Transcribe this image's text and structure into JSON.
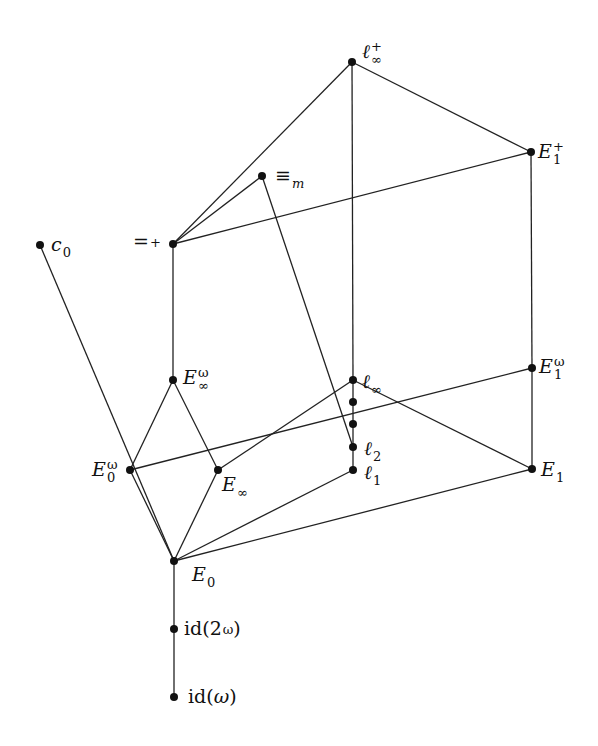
{
  "diagram": {
    "type": "hasse-diagram",
    "nodes": [
      {
        "id": "linf_plus",
        "base": "ℓ",
        "sub": "∞",
        "sup": "+",
        "x": 352,
        "y": 62,
        "lx": 362,
        "ly": 40
      },
      {
        "id": "E1_plus",
        "base": "E",
        "sub": "1",
        "sup": "+",
        "x": 531,
        "y": 152,
        "lx": 538,
        "ly": 140
      },
      {
        "id": "equiv_m",
        "base": "≡",
        "sub": "m",
        "sup": "",
        "x": 262,
        "y": 176,
        "lx": 275,
        "ly": 164
      },
      {
        "id": "eq_plus",
        "base": "=",
        "sub": "",
        "sup": "+",
        "x": 173,
        "y": 244,
        "lx": 133,
        "ly": 232
      },
      {
        "id": "c0",
        "base": "c",
        "sub": "0",
        "sup": "",
        "x": 40,
        "y": 245,
        "lx": 51,
        "ly": 233
      },
      {
        "id": "Einf_omega",
        "base": "E",
        "sub": "∞",
        "sup": "ω",
        "x": 173,
        "y": 380,
        "lx": 183,
        "ly": 366
      },
      {
        "id": "linf",
        "base": "ℓ",
        "sub": "∞",
        "sup": "",
        "x": 353,
        "y": 380,
        "lx": 362,
        "ly": 370
      },
      {
        "id": "dot1",
        "base": "",
        "sub": "",
        "sup": "",
        "x": 353,
        "y": 402
      },
      {
        "id": "dot2",
        "base": "",
        "sub": "",
        "sup": "",
        "x": 353,
        "y": 424
      },
      {
        "id": "l2",
        "base": "ℓ",
        "sub": "2",
        "sup": "",
        "x": 353,
        "y": 447,
        "lx": 364,
        "ly": 437
      },
      {
        "id": "l1",
        "base": "ℓ",
        "sub": "1",
        "sup": "",
        "x": 353,
        "y": 470,
        "lx": 364,
        "ly": 461
      },
      {
        "id": "E1_omega",
        "base": "E",
        "sub": "1",
        "sup": "ω",
        "x": 532,
        "y": 368,
        "lx": 539,
        "ly": 355
      },
      {
        "id": "E1",
        "base": "E",
        "sub": "1",
        "sup": "",
        "x": 532,
        "y": 469,
        "lx": 541,
        "ly": 458
      },
      {
        "id": "E0_omega",
        "base": "E",
        "sub": "0",
        "sup": "ω",
        "x": 130,
        "y": 470,
        "lx": 92,
        "ly": 458
      },
      {
        "id": "Einf",
        "base": "E",
        "sub": "∞",
        "sup": "",
        "x": 218,
        "y": 470,
        "lx": 222,
        "ly": 473
      },
      {
        "id": "E0",
        "base": "E",
        "sub": "0",
        "sup": "",
        "x": 174,
        "y": 561,
        "lx": 192,
        "ly": 563
      },
      {
        "id": "id_2omega",
        "base": "id(2",
        "sub": "",
        "sup": "ω",
        "tail": ")",
        "upright": true,
        "x": 174,
        "y": 629,
        "lx": 184,
        "ly": 619
      },
      {
        "id": "id_omega",
        "base": "id(",
        "sub": "",
        "sup": "",
        "mid": "ω",
        "tail": ")",
        "upright": true,
        "x": 174,
        "y": 697,
        "lx": 188,
        "ly": 687
      }
    ],
    "edges": [
      [
        "linf_plus",
        "eq_plus"
      ],
      [
        "linf_plus",
        "linf"
      ],
      [
        "linf_plus",
        "E1_plus"
      ],
      [
        "E1_plus",
        "eq_plus"
      ],
      [
        "E1_plus",
        "E1_omega"
      ],
      [
        "equiv_m",
        "eq_plus"
      ],
      [
        "equiv_m",
        "l2"
      ],
      [
        "eq_plus",
        "Einf_omega"
      ],
      [
        "Einf_omega",
        "E0_omega"
      ],
      [
        "Einf_omega",
        "Einf"
      ],
      [
        "linf",
        "Einf"
      ],
      [
        "linf",
        "E1"
      ],
      [
        "linf",
        "l1"
      ],
      [
        "E1_omega",
        "E0_omega"
      ],
      [
        "E1_omega",
        "E1"
      ],
      [
        "E0",
        "E0_omega"
      ],
      [
        "E0",
        "Einf"
      ],
      [
        "E0",
        "l1"
      ],
      [
        "E0",
        "E1"
      ],
      [
        "E0",
        "c0"
      ],
      [
        "E0",
        "id_2omega"
      ],
      [
        "id_2omega",
        "id_omega"
      ]
    ],
    "labels": {
      "linf_plus": "ℓ∞⁺",
      "E1_plus": "E₁⁺",
      "equiv_m": "≡ₘ",
      "eq_plus": "=⁺",
      "c0": "c₀",
      "Einf_omega": "E∞^ω",
      "linf": "ℓ∞",
      "l2": "ℓ₂",
      "l1": "ℓ₁",
      "E1_omega": "E₁^ω",
      "E1": "E₁",
      "E0_omega": "E₀^ω",
      "Einf": "E∞",
      "E0": "E₀",
      "id_2omega": "id(2^ω)",
      "id_omega": "id(ω)"
    }
  }
}
